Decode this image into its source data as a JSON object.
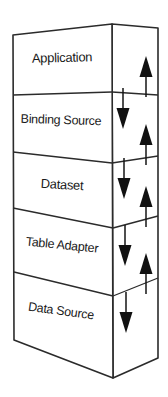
{
  "diagram": {
    "type": "layered-stack-3d",
    "stroke_color": "#2b2b2b",
    "fill_color": "#ffffff",
    "arrow_color": "#111111",
    "layers": [
      {
        "id": "application",
        "label": "Application"
      },
      {
        "id": "binding-source",
        "label": "Binding Source"
      },
      {
        "id": "dataset",
        "label": "Dataset"
      },
      {
        "id": "table-adapter",
        "label": "Table Adapter"
      },
      {
        "id": "data-source",
        "label": "Data Source"
      }
    ],
    "flows": {
      "down_label": "down-arrow",
      "up_label": "up-arrow",
      "down_count": 4,
      "up_count": 4,
      "description": "Bidirectional data flow between adjacent layers"
    }
  }
}
